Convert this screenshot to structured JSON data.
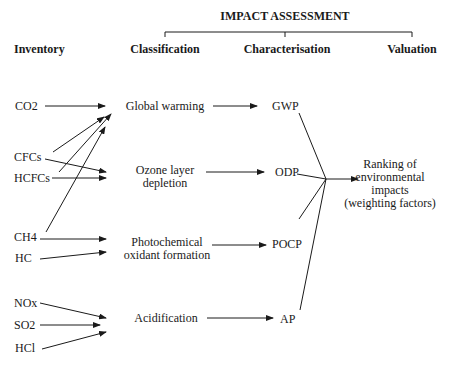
{
  "header": {
    "title": "IMPACT ASSESSMENT",
    "columns": {
      "inventory": "Inventory",
      "classification": "Classification",
      "characterisation": "Characterisation",
      "valuation": "Valuation"
    }
  },
  "inventory": [
    "CO2",
    "CFCs",
    "HCFCs",
    "CH4",
    "HC",
    "NOx",
    "SO2",
    "HCl"
  ],
  "classification": {
    "global_warming": "Global warming",
    "ozone_1": "Ozone layer",
    "ozone_2": "depletion",
    "photo_1": "Photochemical",
    "photo_2": "oxidant formation",
    "acidification": "Acidification"
  },
  "characterisation": [
    "GWP",
    "ODP",
    "POCP",
    "AP"
  ],
  "valuation": {
    "line1": "Ranking of",
    "line2": "environmental",
    "line3": "impacts",
    "line4": "(weighting factors)"
  }
}
